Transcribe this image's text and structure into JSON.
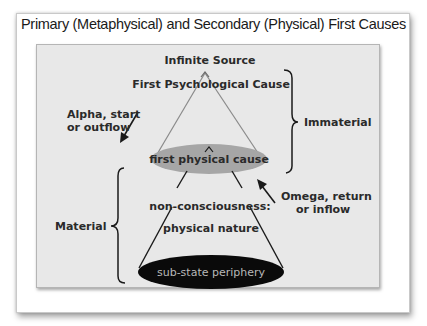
{
  "title": "Primary (Metaphysical) and Secondary (Physical) First Causes",
  "nodes": {
    "infinite_source": "Infinite Source",
    "first_psychological_cause": "First Psychological Cause",
    "first_physical_cause": "first physical cause",
    "non_consciousness_line1": "non-consciousness:",
    "non_consciousness_line2": "physical nature",
    "sub_state_periphery": "sub-state periphery"
  },
  "arrows": {
    "alpha_line1": "Alpha, start",
    "alpha_line2": "or outflow",
    "omega_line1": "Omega, return",
    "omega_line2": "or inflow"
  },
  "braces": {
    "immaterial": "Immaterial",
    "material": "Material"
  },
  "colors": {
    "panel_bg": "#e8e8e8",
    "first_physical_ellipse": "#a6a6a6",
    "sub_state_ellipse": "#0a0a0a",
    "sub_state_text": "#b8b8b8",
    "text": "#2a2a2a"
  }
}
